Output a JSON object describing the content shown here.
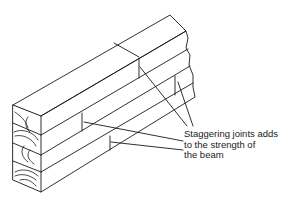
{
  "figure": {
    "annotation": {
      "lines": [
        "Staggering joints adds",
        "to the strength of",
        "the beam"
      ]
    },
    "colors": {
      "ink": "#1a1a1a",
      "background": "#ffffff"
    }
  }
}
